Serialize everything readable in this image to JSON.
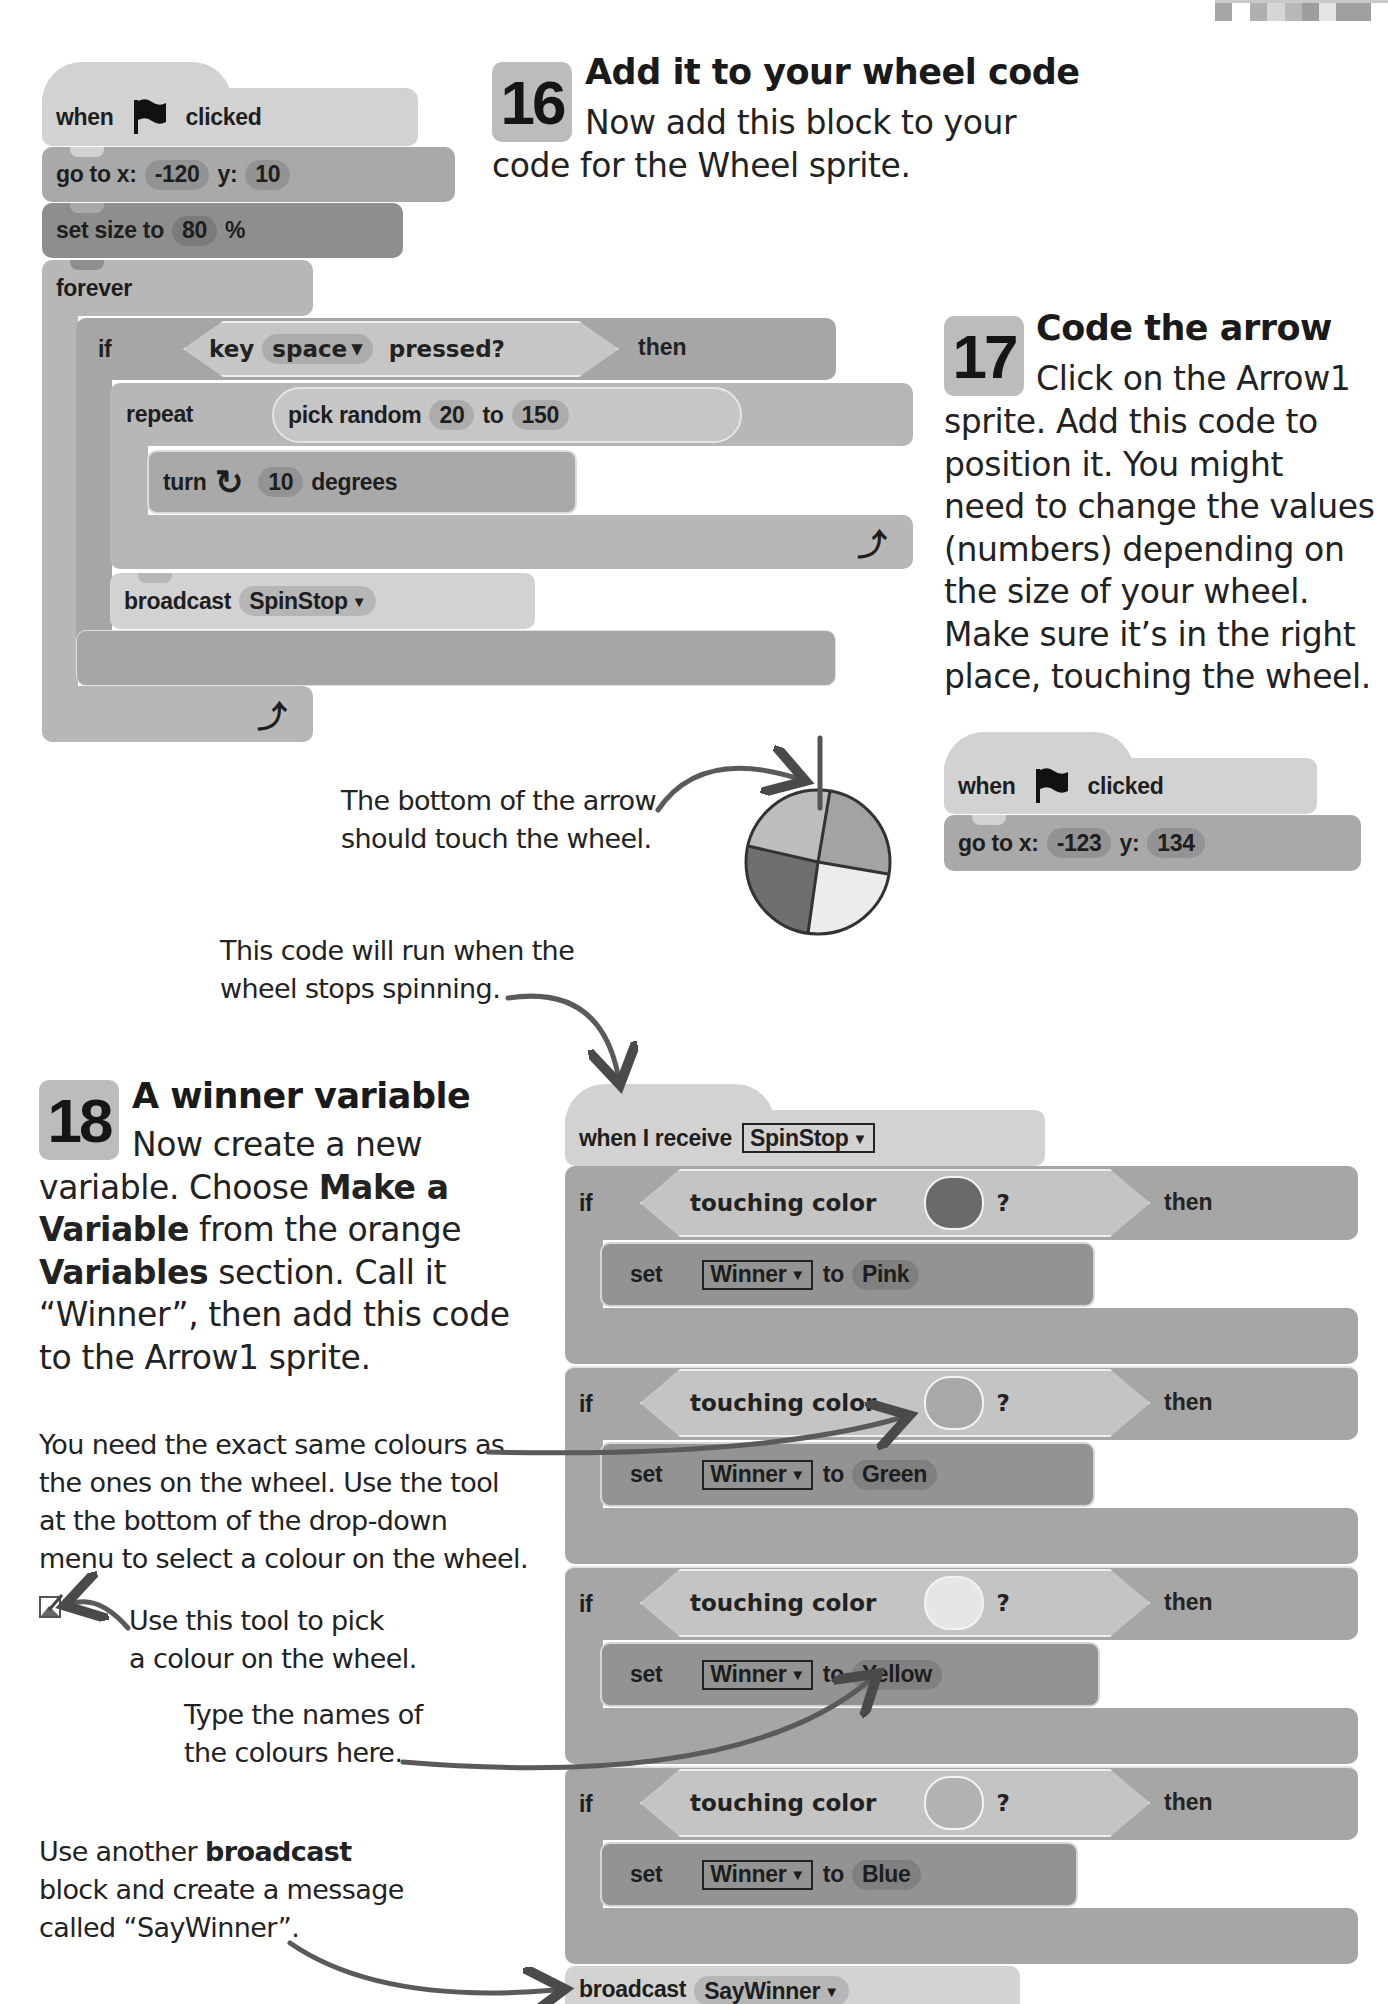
{
  "header_strip": {
    "icon": "pixel-strip-decoration"
  },
  "step16": {
    "number": "16",
    "title": "Add it to your wheel code",
    "text_line1": "Now add this block to your",
    "text_line2": "code for the Wheel sprite."
  },
  "script_wheel": {
    "hat": {
      "when": "when",
      "clicked": "clicked",
      "icon": "green-flag-icon"
    },
    "goto": {
      "label": "go to x:",
      "x": "-120",
      "y_label": "y:",
      "y": "10"
    },
    "set_size": {
      "label": "set size to",
      "value": "80",
      "unit": "%"
    },
    "forever": {
      "label": "forever"
    },
    "if_key": {
      "if": "if",
      "key": "key",
      "key_value": "space",
      "pressed": "pressed?",
      "then": "then"
    },
    "repeat": {
      "label": "repeat",
      "pick": "pick random",
      "from": "20",
      "to": "to",
      "to_value": "150"
    },
    "turn": {
      "label": "turn",
      "value": "10",
      "unit": "degrees"
    },
    "broadcast": {
      "label": "broadcast",
      "message": "SpinStop"
    }
  },
  "step17": {
    "number": "17",
    "title": "Code the arrow",
    "lines": [
      "Click on the Arrow1",
      "sprite. Add this code to",
      "position it. You might",
      "need to change the values",
      "(numbers) depending on",
      "the size of your wheel.",
      "Make sure it’s in the right",
      "place, touching the wheel."
    ]
  },
  "script_arrow": {
    "hat": {
      "when": "when",
      "clicked": "clicked"
    },
    "goto": {
      "label": "go to x:",
      "x": "-123",
      "y_label": "y:",
      "y": "134"
    }
  },
  "annotations": {
    "arrow_bottom": [
      "The bottom of the arrow",
      "should touch the wheel."
    ],
    "runs_when": [
      "This code will run when the",
      "wheel stops spinning."
    ],
    "exact_colours": [
      "You need the exact same colours as",
      "the ones on the wheel. Use the tool",
      "at the bottom of the drop-down",
      "menu to select a colour on the wheel."
    ],
    "picker_tool": [
      "Use this tool to pick",
      "a colour on the wheel."
    ],
    "type_names": [
      "Type the names of",
      "the colours here."
    ],
    "broadcast_note": {
      "pre": "Use another ",
      "bold": "broadcast",
      "line2": "block and create a message",
      "line3": "called “SayWinner”."
    }
  },
  "wheel": {
    "segments": [
      {
        "name": "top-left",
        "color": "#bdbdbd"
      },
      {
        "name": "top-right",
        "color": "#a3a3a3"
      },
      {
        "name": "bottom-right",
        "color": "#ececec"
      },
      {
        "name": "bottom-left",
        "color": "#6f6f6f"
      }
    ]
  },
  "step18": {
    "number": "18",
    "title": "A winner variable",
    "line1": "Now create a new",
    "line2_pre": "variable. Choose ",
    "line2_bold": "Make a",
    "line3_bold": "Variable",
    "line3_rest": " from the orange",
    "line4_bold": "Variables",
    "line4_rest": " section. Call it",
    "line5": "“Winner”, then add this code",
    "line6": "to the Arrow1 sprite."
  },
  "script_winner": {
    "hat": {
      "label": "when I receive",
      "message": "SpinStop"
    },
    "conditions": [
      {
        "if": "if",
        "sensing": "touching color",
        "q": "?",
        "then": "then",
        "swatch": "#6a6a6a",
        "set": "set",
        "var": "Winner",
        "to": "to",
        "value": "Pink"
      },
      {
        "if": "if",
        "sensing": "touching color",
        "q": "?",
        "then": "then",
        "swatch": "#a8a8a8",
        "set": "set",
        "var": "Winner",
        "to": "to",
        "value": "Green"
      },
      {
        "if": "if",
        "sensing": "touching color",
        "q": "?",
        "then": "then",
        "swatch": "#e6e6e6",
        "set": "set",
        "var": "Winner",
        "to": "to",
        "value": "Yellow"
      },
      {
        "if": "if",
        "sensing": "touching color",
        "q": "?",
        "then": "then",
        "swatch": "#b2b2b2",
        "set": "set",
        "var": "Winner",
        "to": "to",
        "value": "Blue"
      }
    ],
    "broadcast": {
      "label": "broadcast",
      "message": "SayWinner"
    }
  }
}
